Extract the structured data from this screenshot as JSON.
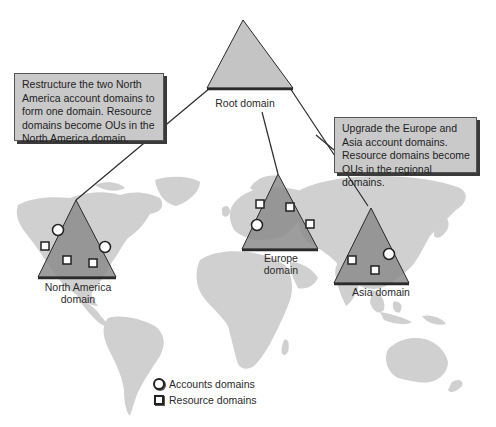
{
  "diagram": {
    "root": {
      "label": "Root domain"
    },
    "callouts": {
      "north_america": "Restructure the two North America account domains to form one domain.  Resource domains become OUs in the North America domain.",
      "europe_asia": "Upgrade the Europe and Asia account domains.  Resource domains become OUs in the regional domains."
    },
    "domains": [
      {
        "id": "north_america",
        "label_line1": "North America",
        "label_line2": "domain",
        "account_domains": 2,
        "resource_domains": 3
      },
      {
        "id": "europe",
        "label_line1": "Europe",
        "label_line2": "domain",
        "account_domains": 1,
        "resource_domains": 3
      },
      {
        "id": "asia",
        "label_line1": "Asia domain",
        "label_line2": "",
        "account_domains": 1,
        "resource_domains": 2
      }
    ],
    "legend": {
      "accounts": "Accounts domains",
      "resource": "Resource domains"
    },
    "colors": {
      "land": "#d0d0d0",
      "triangle_root": "#c4c4c4",
      "triangle_domain": "#8c8c8c",
      "triangle_edge": "#2a2a2a",
      "callout_bg": "#c9c9c9",
      "line": "#2a2a2a"
    }
  }
}
